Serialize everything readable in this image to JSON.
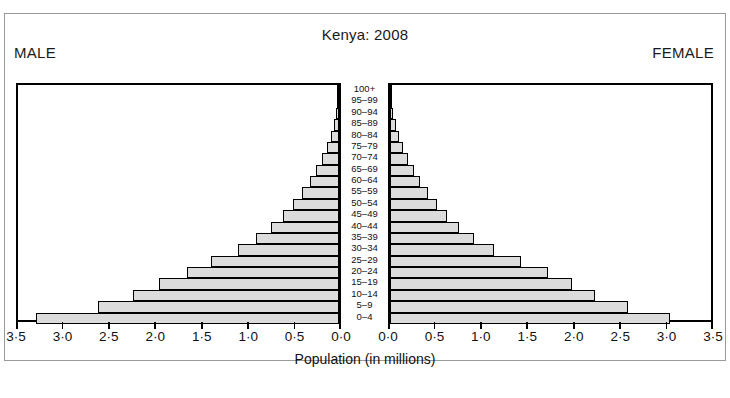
{
  "figure": {
    "title": "Kenya:  2008",
    "male_label": "MALE",
    "female_label": "FEMALE",
    "xaxis_title": "Population (in millions)"
  },
  "chart_data": {
    "type": "bar",
    "subtype": "population-pyramid",
    "title": "Kenya:  2008",
    "xlabel": "Population (in millions)",
    "ylabel": "",
    "xlim": [
      0,
      3.5
    ],
    "grid": false,
    "orientation": "horizontal",
    "units": "millions",
    "categories": [
      "0–4",
      "5–9",
      "10–14",
      "15–19",
      "20–24",
      "25–29",
      "30–34",
      "35–39",
      "40–44",
      "45–49",
      "50–54",
      "55–59",
      "60–64",
      "65–69",
      "70–74",
      "75–79",
      "80–84",
      "85–89",
      "90–94",
      "95–99",
      "100+"
    ],
    "axis_ticks": [
      0.0,
      0.5,
      1.0,
      1.5,
      2.0,
      2.5,
      3.0,
      3.5
    ],
    "axis_tick_labels_male": [
      "3·5",
      "3·0",
      "2·5",
      "2·0",
      "1·5",
      "1·0",
      "0·5",
      "0·0"
    ],
    "axis_tick_labels_female": [
      "0·0",
      "0·5",
      "1·0",
      "1·5",
      "2·0",
      "2·5",
      "3·0",
      "3·5"
    ],
    "series": [
      {
        "name": "MALE",
        "side": "left",
        "values": [
          3.3,
          2.63,
          2.25,
          1.96,
          1.66,
          1.4,
          1.1,
          0.9,
          0.74,
          0.61,
          0.5,
          0.4,
          0.32,
          0.25,
          0.19,
          0.13,
          0.09,
          0.055,
          0.03,
          0.016,
          0.008
        ]
      },
      {
        "name": "FEMALE",
        "side": "right",
        "values": [
          3.05,
          2.6,
          2.23,
          1.98,
          1.72,
          1.43,
          1.13,
          0.92,
          0.75,
          0.62,
          0.51,
          0.41,
          0.33,
          0.26,
          0.2,
          0.14,
          0.1,
          0.06,
          0.033,
          0.017,
          0.009
        ]
      }
    ],
    "colors": {
      "bar_fill": "#dcdcdc",
      "bar_stroke": "#000000",
      "background": "#ffffff",
      "text": "#111111"
    }
  }
}
